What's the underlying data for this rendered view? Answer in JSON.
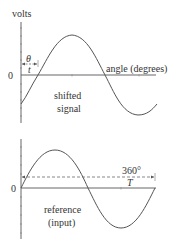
{
  "diagram": {
    "colors": {
      "line": "#333333",
      "curve": "#555555",
      "axis": "#555555"
    },
    "top_plot": {
      "y_axis_label": "volts",
      "zero_label": "0",
      "x_axis_label": "angle (degrees)",
      "curve_label_line1": "shifted",
      "curve_label_line2": "signal",
      "shift_angle_symbol": "θ",
      "shift_time_symbol": "t"
    },
    "bottom_plot": {
      "zero_label": "0",
      "period_angle": "360°",
      "period_symbol": "T",
      "curve_label_line1": "reference",
      "curve_label_line2": "(input)"
    }
  }
}
